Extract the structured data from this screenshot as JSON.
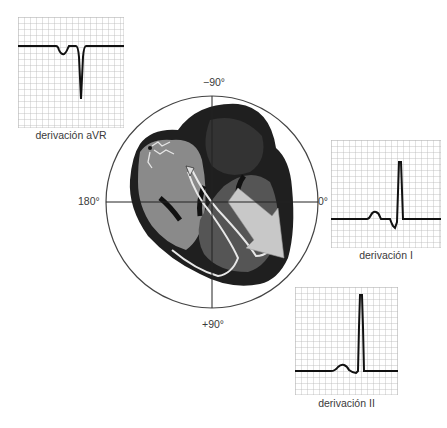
{
  "figure": {
    "axis_labels": {
      "top": "−90°",
      "bottom": "+90°",
      "left": "180°",
      "right": "0°"
    },
    "leads": [
      {
        "id": "avr",
        "label": "derivación aVR",
        "morphology": "negative QRS, inverted P"
      },
      {
        "id": "i",
        "label": "derivación I",
        "morphology": "positive QRS, small upright P"
      },
      {
        "id": "ii",
        "label": "derivación II",
        "morphology": "tall positive QRS, upright P"
      }
    ],
    "heart": {
      "vector_arrow": "mean QRS axis pointing toward ~+45°",
      "colors": {
        "outline": "#1a1a1a",
        "atria": "#8a8a8a",
        "ventricle_dark": "#2b2b2b",
        "ventricle_mid": "#555555",
        "arrow": "#c8c8c8",
        "conduction": "#e8e8e8"
      }
    },
    "colors": {
      "grid": "#b8b8b8",
      "trace": "#111111",
      "circle": "#444444",
      "text": "#3a3a3a"
    }
  }
}
